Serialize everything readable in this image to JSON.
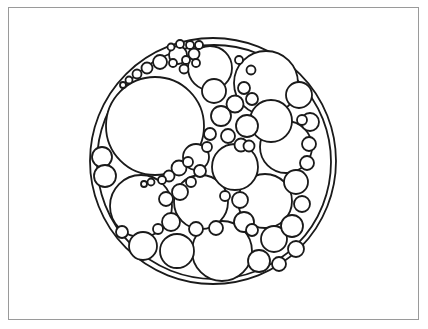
{
  "figure": {
    "kind": "circle-packing-diagram",
    "title": "",
    "caption": "",
    "background_color": "#ffffff",
    "frame": {
      "border_color": "#9a9a9a",
      "border_width": 1,
      "x": 8,
      "y": 7,
      "width": 411,
      "height": 313
    },
    "stroke_color": "#1a1a1a",
    "fill_color": "#ffffff"
  },
  "chart_data": {
    "type": "scatter",
    "title": "",
    "xlabel": "",
    "ylabel": "",
    "grid": false,
    "legend_position": "none",
    "xlim": [
      0,
      428
    ],
    "ylim": [
      0,
      329
    ],
    "units": "pixels",
    "circle_count": 76,
    "columns": [
      "cx",
      "cy",
      "r",
      "stroke_width"
    ],
    "circles": [
      [
        213,
        161,
        123,
        1.8
      ],
      [
        214,
        162,
        117,
        1.8
      ],
      [
        155,
        126,
        49,
        1.8
      ],
      [
        266,
        83,
        32,
        1.8
      ],
      [
        210,
        68,
        22,
        1.8
      ],
      [
        141,
        206,
        31,
        1.8
      ],
      [
        222,
        251,
        30,
        1.8
      ],
      [
        286,
        147,
        26,
        1.8
      ],
      [
        201,
        202,
        27,
        1.8
      ],
      [
        265,
        201,
        27,
        1.8
      ],
      [
        235,
        167,
        23,
        1.8
      ],
      [
        271,
        121,
        21,
        1.8
      ],
      [
        299,
        95,
        13,
        1.8
      ],
      [
        310,
        122,
        9,
        1.8
      ],
      [
        247,
        126,
        11,
        1.8
      ],
      [
        221,
        116,
        10,
        1.8
      ],
      [
        235,
        104,
        8.5,
        1.8
      ],
      [
        228,
        136,
        7,
        1.8
      ],
      [
        210,
        134,
        6,
        1.8
      ],
      [
        241,
        145,
        6.5,
        1.8
      ],
      [
        214,
        91,
        12,
        1.8
      ],
      [
        249,
        146,
        5.5,
        1.8
      ],
      [
        302,
        120,
        5,
        1.8
      ],
      [
        251,
        70,
        4.5,
        1.8
      ],
      [
        239,
        60,
        4,
        1.8
      ],
      [
        102,
        157,
        10,
        1.8
      ],
      [
        105,
        176,
        11,
        1.8
      ],
      [
        196,
        157,
        13,
        1.8
      ],
      [
        179,
        168,
        7.5,
        1.8
      ],
      [
        169,
        176,
        5.5,
        1.8
      ],
      [
        162,
        180,
        4,
        1.8
      ],
      [
        188,
        162,
        5,
        1.8
      ],
      [
        151,
        182,
        3.5,
        1.8
      ],
      [
        144,
        184,
        3,
        1.8
      ],
      [
        252,
        99,
        6,
        1.8
      ],
      [
        244,
        88,
        6,
        1.8
      ],
      [
        160,
        62,
        7,
        1.8
      ],
      [
        147,
        68,
        5.5,
        1.8
      ],
      [
        137,
        74,
        4.5,
        1.8
      ],
      [
        129,
        80,
        3.5,
        1.8
      ],
      [
        123,
        85,
        3,
        1.8
      ],
      [
        178,
        55,
        9,
        1.8
      ],
      [
        184,
        69,
        4.5,
        1.8
      ],
      [
        194,
        54,
        5.5,
        1.8
      ],
      [
        190,
        45,
        4,
        1.8
      ],
      [
        180,
        44,
        4,
        1.8
      ],
      [
        171,
        47,
        3.5,
        1.8
      ],
      [
        199,
        45,
        4,
        1.8
      ],
      [
        186,
        60,
        4,
        1.8
      ],
      [
        196,
        63,
        4,
        1.8
      ],
      [
        173,
        63,
        4,
        1.8
      ],
      [
        180,
        192,
        8,
        1.8
      ],
      [
        166,
        199,
        7,
        1.8
      ],
      [
        143,
        246,
        14,
        1.8
      ],
      [
        177,
        251,
        17,
        1.8
      ],
      [
        171,
        222,
        9,
        1.8
      ],
      [
        196,
        229,
        7,
        1.8
      ],
      [
        274,
        239,
        13,
        1.8
      ],
      [
        292,
        226,
        11,
        1.8
      ],
      [
        259,
        261,
        11,
        1.8
      ],
      [
        296,
        249,
        8,
        1.8
      ],
      [
        279,
        264,
        7,
        1.8
      ],
      [
        244,
        222,
        10,
        1.8
      ],
      [
        296,
        182,
        12,
        1.8
      ],
      [
        302,
        204,
        8,
        1.8
      ],
      [
        240,
        200,
        8,
        1.8
      ],
      [
        252,
        230,
        6,
        1.8
      ],
      [
        307,
        163,
        7,
        1.8
      ],
      [
        309,
        144,
        7,
        1.8
      ],
      [
        216,
        228,
        7,
        1.8
      ],
      [
        200,
        171,
        6,
        1.8
      ],
      [
        122,
        232,
        6,
        1.8
      ],
      [
        158,
        229,
        5,
        1.8
      ],
      [
        207,
        147,
        5,
        1.8
      ],
      [
        225,
        196,
        5,
        1.8
      ],
      [
        191,
        182,
        5,
        1.8
      ]
    ]
  }
}
